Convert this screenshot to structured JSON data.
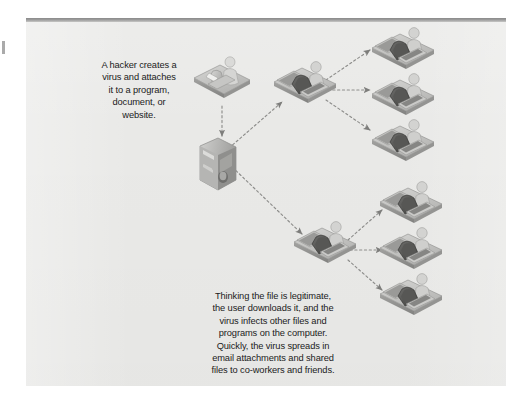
{
  "figure": {
    "background_color": "#e9e9e7",
    "page_color": "#ffffff",
    "rule_color": "#8a8a8a",
    "text_color": "#1b1b1b",
    "arrow_color": "#8d8d8d"
  },
  "captions": {
    "hacker": "A hacker creates a\nvirus and attaches\nit to a program,\ndocument, or\nwebsite.",
    "user": "Thinking the file is legitimate,\nthe user downloads it, and the\nvirus infects other files and\nprograms on the computer.\nQuickly, the virus spreads in\nemail attachments and shared\nfiles to co-workers and friends."
  },
  "nodes": [
    {
      "id": "hacker",
      "icon": "person-at-computer-icon",
      "label": "hacker at computer",
      "x": 196,
      "y": 58,
      "scale": 1.0
    },
    {
      "id": "server",
      "icon": "server-tower-icon",
      "label": "server hosting infected file",
      "x": 198,
      "y": 142,
      "scale": 1.0
    },
    {
      "id": "victim-top",
      "icon": "person-at-desk-icon",
      "label": "infected user computer",
      "x": 276,
      "y": 62,
      "scale": 1.0
    },
    {
      "id": "victim-bottom",
      "icon": "person-at-desk-icon",
      "label": "infected user computer",
      "x": 296,
      "y": 222,
      "scale": 1.0
    },
    {
      "id": "spread-top-1",
      "icon": "person-at-desk-icon",
      "label": "co-worker computer",
      "x": 374,
      "y": 28,
      "scale": 1.0
    },
    {
      "id": "spread-top-2",
      "icon": "person-at-desk-icon",
      "label": "co-worker computer",
      "x": 374,
      "y": 74,
      "scale": 1.0
    },
    {
      "id": "spread-top-3",
      "icon": "person-at-desk-icon",
      "label": "co-worker computer",
      "x": 374,
      "y": 120,
      "scale": 1.0
    },
    {
      "id": "spread-bot-1",
      "icon": "person-at-desk-icon",
      "label": "friend computer",
      "x": 382,
      "y": 182,
      "scale": 1.0
    },
    {
      "id": "spread-bot-2",
      "icon": "person-at-desk-icon",
      "label": "friend computer",
      "x": 382,
      "y": 228,
      "scale": 1.0
    },
    {
      "id": "spread-bot-3",
      "icon": "person-at-desk-icon",
      "label": "friend computer",
      "x": 382,
      "y": 274,
      "scale": 1.0
    }
  ],
  "arrows": [
    {
      "id": "hacker-to-server",
      "from": "hacker",
      "to": "server",
      "style": "dotted"
    },
    {
      "id": "server-to-victim-top",
      "from": "server",
      "to": "victim-top",
      "style": "dotted"
    },
    {
      "id": "server-to-victim-bottom",
      "from": "server",
      "to": "victim-bottom",
      "style": "dotted"
    },
    {
      "id": "victim-top-to-spread-1",
      "from": "victim-top",
      "to": "spread-top-1",
      "style": "dotted"
    },
    {
      "id": "victim-top-to-spread-2",
      "from": "victim-top",
      "to": "spread-top-2",
      "style": "dotted"
    },
    {
      "id": "victim-top-to-spread-3",
      "from": "victim-top",
      "to": "spread-top-3",
      "style": "dotted"
    },
    {
      "id": "victim-bot-to-spread-1",
      "from": "victim-bottom",
      "to": "spread-bot-1",
      "style": "dotted"
    },
    {
      "id": "victim-bot-to-spread-2",
      "from": "victim-bottom",
      "to": "spread-bot-2",
      "style": "dotted"
    },
    {
      "id": "victim-bot-to-spread-3",
      "from": "victim-bottom",
      "to": "spread-bot-3",
      "style": "dotted"
    }
  ]
}
